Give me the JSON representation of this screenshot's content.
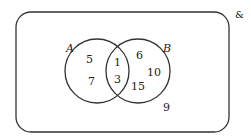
{
  "universal_symbol": "&",
  "sets": {
    "A": {
      "label": "A"
    },
    "B": {
      "label": "B"
    }
  },
  "regions": {
    "only_A": [
      "5",
      "7"
    ],
    "A_and_B": [
      "1",
      "3"
    ],
    "only_B": [
      "6",
      "10",
      "15"
    ],
    "outside": [
      "9"
    ]
  }
}
